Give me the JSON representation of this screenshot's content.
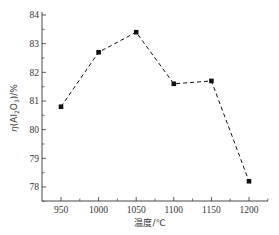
{
  "chart_data": {
    "type": "line",
    "title": "",
    "xlabel": "温度/℃",
    "ylabel": "η(Al2O3)/%",
    "ylabel_parts": {
      "prefix": "η(Al",
      "sub1": "2",
      "mid": "O",
      "sub2": "3",
      "suffix": ")/%"
    },
    "x": [
      950,
      1000,
      1050,
      1100,
      1150,
      1200
    ],
    "series": [
      {
        "name": "η(Al2O3)",
        "values": [
          80.8,
          82.7,
          83.4,
          81.6,
          81.7,
          78.2
        ],
        "line_style": "dashed",
        "marker": "square",
        "color": "#111111"
      }
    ],
    "xlim": [
      925,
      1225
    ],
    "ylim": [
      77.5,
      84
    ],
    "xticks": [
      950,
      1000,
      1050,
      1100,
      1150,
      1200
    ],
    "yticks": [
      78,
      79,
      80,
      81,
      82,
      83,
      84
    ],
    "grid": false,
    "legend": null
  }
}
